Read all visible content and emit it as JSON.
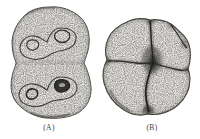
{
  "figure": {
    "colors": {
      "paper": "#ffffff",
      "shape_fill": "#e7e5e1",
      "ink": "#3a3834"
    },
    "items": [
      {
        "id": "A",
        "label": "(A)"
      },
      {
        "id": "B",
        "label": "(B)"
      }
    ]
  }
}
